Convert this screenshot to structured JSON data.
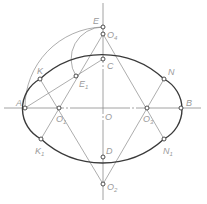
{
  "diagram": {
    "center": {
      "name": "O",
      "x": 103,
      "y": 108
    },
    "axes": {
      "horizontal": {
        "x1": 4,
        "x2": 201,
        "y": 108
      },
      "vertical": {
        "x": 103,
        "y1": 3,
        "y2": 200
      }
    },
    "points": {
      "A": {
        "label": "A",
        "x": 25,
        "y": 108
      },
      "B": {
        "label": "B",
        "x": 181,
        "y": 108
      },
      "C": {
        "label": "C",
        "x": 103,
        "y": 59
      },
      "D": {
        "label": "D",
        "x": 103,
        "y": 157
      },
      "E": {
        "label": "E",
        "x": 103,
        "y": 27
      },
      "E1": {
        "label": "E",
        "sub": "1",
        "x": 76,
        "y": 76
      },
      "O1": {
        "label": "O",
        "sub": "1",
        "x": 59,
        "y": 108
      },
      "O2": {
        "label": "O",
        "sub": "2",
        "x": 103,
        "y": 184
      },
      "O3": {
        "label": "O",
        "sub": "3",
        "x": 147,
        "y": 108
      },
      "O4": {
        "label": "O",
        "sub": "4",
        "x": 103,
        "y": 34
      },
      "K": {
        "label": "K",
        "x": 40,
        "y": 79
      },
      "K1": {
        "label": "K",
        "sub": "1",
        "x": 41,
        "y": 139
      },
      "N": {
        "label": "N",
        "x": 164,
        "y": 79
      },
      "N1": {
        "label": "N",
        "sub": "1",
        "x": 164,
        "y": 139
      }
    },
    "labels": {
      "A": "A",
      "B": "B",
      "C": "C",
      "D": "D",
      "E": "E",
      "O": "O",
      "E1": "E",
      "E1_sub": "1",
      "O1": "O",
      "O1_sub": "1",
      "O2": "O",
      "O2_sub": "2",
      "O3": "O",
      "O3_sub": "3",
      "O4": "O",
      "O4_sub": "4",
      "K": "K",
      "K1": "K",
      "K1_sub": "1",
      "N": "N",
      "N1": "N",
      "N1_sub": "1"
    },
    "colors": {
      "outline": "#3a3a3a",
      "construction": "#8a8a8a",
      "label": "#9a9a9a"
    }
  }
}
